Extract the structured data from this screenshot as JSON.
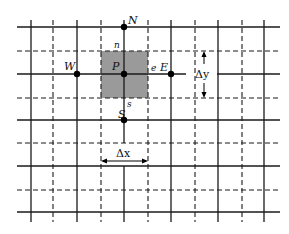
{
  "diagram": {
    "nodes": {
      "P": "P",
      "N": "N",
      "S": "S",
      "E": "E",
      "W": "W"
    },
    "faces": {
      "n": "n",
      "s": "s",
      "e": "e"
    },
    "dimensions": {
      "dx": "Δx",
      "dy": "Δy"
    },
    "colors": {
      "grid_line": "#1a1a1a",
      "control_volume": "#9a9a9a",
      "node": "#000000",
      "background": "#ffffff"
    }
  }
}
